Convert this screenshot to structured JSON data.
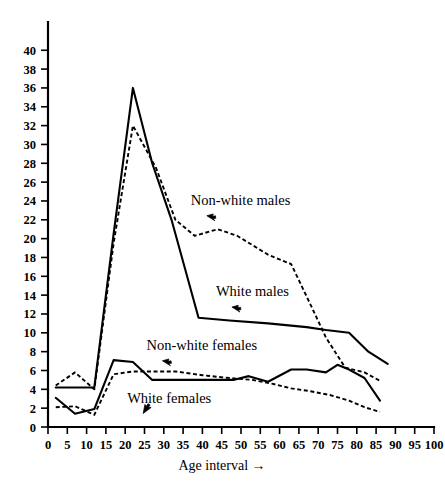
{
  "chart_data": {
    "type": "line",
    "title": "",
    "xlabel": "Age interval  →",
    "ylabel": "",
    "xlim": [
      0,
      100
    ],
    "ylim": [
      0,
      43
    ],
    "grid": false,
    "legend_position": "inline-annotations",
    "xticks": [
      0,
      5,
      10,
      15,
      20,
      25,
      30,
      35,
      40,
      45,
      50,
      55,
      60,
      65,
      70,
      75,
      80,
      85,
      90,
      95,
      100
    ],
    "xticklabels": [
      "0",
      "5",
      "10",
      "15",
      "20",
      "25",
      "30",
      "35",
      "40",
      "45",
      "50",
      "55",
      "60",
      "65",
      "70",
      "75",
      "80",
      "85",
      "90",
      "95",
      "100"
    ],
    "yticks": [
      0,
      2,
      4,
      6,
      8,
      10,
      12,
      14,
      16,
      18,
      20,
      22,
      24,
      26,
      28,
      30,
      32,
      34,
      36,
      38,
      40
    ],
    "yticklabels": [
      "0",
      "2",
      "4",
      "6",
      "8",
      "10",
      "12",
      "14",
      "16",
      "18",
      "20",
      "22",
      "24",
      "26",
      "28",
      "30",
      "32",
      "34",
      "36",
      "38",
      "40"
    ],
    "series": [
      {
        "name": "White males",
        "style": "solid",
        "x": [
          2,
          7,
          12,
          17,
          22,
          27,
          32,
          39,
          47,
          57,
          67,
          72,
          78,
          83,
          88
        ],
        "values": [
          4.2,
          4.2,
          4.2,
          20.5,
          36.0,
          28.0,
          22.0,
          11.6,
          11.3,
          11.0,
          10.6,
          10.3,
          10.0,
          8.0,
          6.7
        ]
      },
      {
        "name": "Non-white males",
        "style": "dashed",
        "x": [
          2,
          7,
          12,
          17,
          22,
          28,
          33,
          38,
          44,
          49,
          57,
          63,
          68,
          72,
          77,
          82,
          86
        ],
        "values": [
          4.4,
          5.8,
          4.0,
          19.5,
          32.0,
          27.5,
          22.0,
          20.3,
          21.0,
          20.3,
          18.3,
          17.3,
          13.0,
          9.5,
          6.3,
          5.8,
          4.9
        ]
      },
      {
        "name": "Non-white females",
        "style": "solid",
        "x": [
          2,
          7,
          12,
          17,
          22,
          27,
          35,
          43,
          48,
          52,
          57,
          63,
          67,
          72,
          75,
          78,
          82,
          86
        ],
        "values": [
          3.1,
          1.4,
          1.9,
          7.1,
          6.9,
          5.0,
          5.0,
          5.0,
          5.0,
          5.4,
          4.8,
          6.1,
          6.1,
          5.8,
          6.6,
          6.1,
          5.2,
          2.8
        ]
      },
      {
        "name": "White females",
        "style": "dashed",
        "x": [
          2,
          7,
          12,
          17,
          22,
          28,
          33,
          40,
          47,
          53,
          58,
          63,
          68,
          73,
          78,
          82,
          86
        ],
        "values": [
          2.1,
          2.2,
          1.3,
          5.6,
          5.9,
          5.9,
          5.9,
          5.5,
          5.2,
          5.0,
          4.6,
          4.1,
          3.8,
          3.4,
          2.8,
          2.1,
          1.6
        ]
      }
    ],
    "annotations": [
      {
        "text": "Non-white males",
        "x": 37,
        "y": 23.6
      },
      {
        "text": "White males",
        "x": 43.5,
        "y": 13.9
      },
      {
        "text": "Non-white females",
        "x": 25.5,
        "y": 8.2
      },
      {
        "text": "White females",
        "x": 20.5,
        "y": 2.6
      }
    ]
  },
  "labels": {
    "xaxis_title": "Age interval  →"
  }
}
